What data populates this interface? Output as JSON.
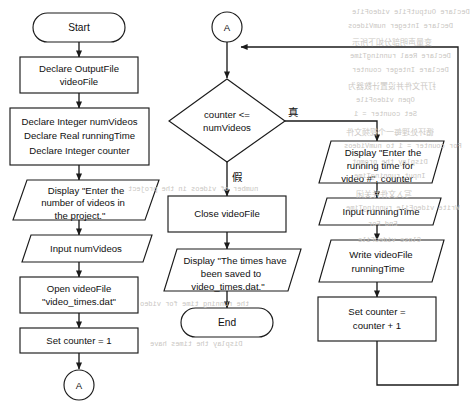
{
  "diagram": {
    "type": "flowchart",
    "branch_labels": {
      "true": "真",
      "false": "假"
    },
    "connector_label": "A",
    "nodes": {
      "start": {
        "shape": "terminal",
        "text": "Start"
      },
      "declare_outputfile": {
        "shape": "process",
        "line1": "Declare OutputFile",
        "line2": "videoFile"
      },
      "declare_vars": {
        "shape": "process",
        "line1": "Declare Integer numVideos",
        "line2": "Declare Real runningTime",
        "line3": "Declare Integer counter"
      },
      "display_prompt": {
        "shape": "io",
        "line1": "Display \"Enter the",
        "line2": "number of videos in",
        "line3": "the project.\""
      },
      "input_numvideos": {
        "shape": "io",
        "line1": "Input numVideos"
      },
      "open_file": {
        "shape": "process",
        "line1": "Open videoFile",
        "line2": "\"video_times.dat\""
      },
      "set_counter_1": {
        "shape": "process",
        "line1": "Set counter = 1"
      },
      "connector_a_bottom": {
        "shape": "connector",
        "text": "A"
      },
      "connector_a_top": {
        "shape": "connector",
        "text": "A"
      },
      "decision": {
        "shape": "decision",
        "line1": "counter <=",
        "line2": "numVideos"
      },
      "close_file": {
        "shape": "process",
        "line1": "Close videoFile"
      },
      "display_saved": {
        "shape": "io",
        "line1": "Display \"The times have",
        "line2": "been saved to",
        "line3": "video_times.dat.\""
      },
      "end": {
        "shape": "terminal",
        "text": "End"
      },
      "display_running_prompt": {
        "shape": "io",
        "line1": "Display \"Enter the",
        "line2": "running time for",
        "line3": "video #\", counter"
      },
      "input_runningtime": {
        "shape": "io",
        "line1": "Input runningTime"
      },
      "write_file": {
        "shape": "io",
        "line1": "Write videoFile",
        "line2": "runningTime"
      },
      "increment_counter": {
        "shape": "process",
        "line1": "Set counter =",
        "line2": "counter + 1"
      }
    },
    "colors": {
      "stroke": "#1b1b1b",
      "fill": "#ffffff",
      "text": "#101010",
      "bleed": "#c9c6c2"
    }
  },
  "bleed": {
    "items": [
      {
        "text": "Declare OutputFile videoFile",
        "x": 352,
        "y": 8,
        "cjk": false
      },
      {
        "text": "Declare Integer numVideos",
        "x": 348,
        "y": 22,
        "cjk": false
      },
      {
        "text": "变量声明部分如下所示",
        "x": 352,
        "y": 36,
        "cjk": true
      },
      {
        "text": "Declare Real runningTime",
        "x": 350,
        "y": 52,
        "cjk": false
      },
      {
        "text": "Declare Integer counter",
        "x": 352,
        "y": 66,
        "cjk": false
      },
      {
        "text": "打开文件并设置计数器为",
        "x": 348,
        "y": 80,
        "cjk": true
      },
      {
        "text": "Open videoFile",
        "x": 356,
        "y": 96,
        "cjk": false
      },
      {
        "text": "Set counter = 1",
        "x": 354,
        "y": 110,
        "cjk": false
      },
      {
        "text": "循环处理每一个视频文件",
        "x": 346,
        "y": 126,
        "cjk": true
      },
      {
        "text": "For counter = 1 to numVideos",
        "x": 344,
        "y": 142,
        "cjk": false
      },
      {
        "text": "Display the prompt",
        "x": 352,
        "y": 158,
        "cjk": false
      },
      {
        "text": "Input runningTime",
        "x": 354,
        "y": 172,
        "cjk": false
      },
      {
        "text": "写入文件并关闭",
        "x": 356,
        "y": 188,
        "cjk": true
      },
      {
        "text": "Write videoFile runningTime",
        "x": 346,
        "y": 204,
        "cjk": false
      },
      {
        "text": "End For",
        "x": 368,
        "y": 220,
        "cjk": false
      },
      {
        "text": "Close videoFile",
        "x": 358,
        "y": 236,
        "cjk": false
      },
      {
        "text": "number of videos in the project",
        "x": 128,
        "y": 185,
        "cjk": false
      },
      {
        "text": "the running time for video",
        "x": 140,
        "y": 300,
        "cjk": false
      },
      {
        "text": "Display the times have",
        "x": 150,
        "y": 340,
        "cjk": false
      }
    ]
  }
}
